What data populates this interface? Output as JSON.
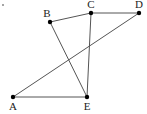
{
  "diagram": {
    "type": "geometry-figure",
    "stroke_color": "#555555",
    "point_color": "#000000",
    "stray_mark": {
      "x": 3,
      "y": 5
    },
    "points": [
      {
        "id": "A",
        "label": "A",
        "x": 13,
        "y": 97,
        "lx": 13,
        "ly": 110
      },
      {
        "id": "B",
        "label": "B",
        "x": 50,
        "y": 22,
        "lx": 47,
        "ly": 17
      },
      {
        "id": "C",
        "label": "C",
        "x": 91,
        "y": 13,
        "lx": 91,
        "ly": 8
      },
      {
        "id": "D",
        "label": "D",
        "x": 139,
        "y": 13,
        "lx": 139,
        "ly": 8
      },
      {
        "id": "E",
        "label": "E",
        "x": 87,
        "y": 97,
        "lx": 87,
        "ly": 110
      }
    ],
    "segments": [
      [
        "B",
        "C"
      ],
      [
        "C",
        "D"
      ],
      [
        "D",
        "A"
      ],
      [
        "A",
        "E"
      ],
      [
        "B",
        "E"
      ],
      [
        "C",
        "E"
      ]
    ]
  }
}
